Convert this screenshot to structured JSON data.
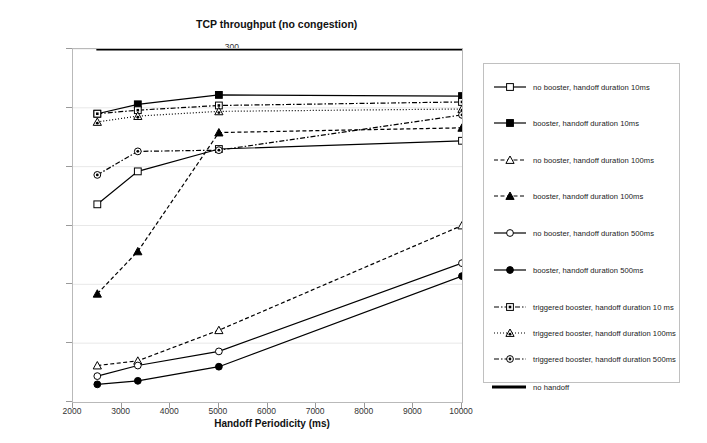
{
  "chart_data": {
    "type": "line",
    "title": "TCP throughput (no congestion)",
    "xlabel": "Handoff Periodicity (ms)",
    "ylabel": "Throughput (KB/s)",
    "xlim": [
      2000,
      10000
    ],
    "ylim": [
      0,
      300
    ],
    "xticks": [
      2000,
      3000,
      4000,
      5000,
      6000,
      7000,
      8000,
      9000,
      10000
    ],
    "yticks": [
      0,
      50,
      100,
      150,
      200,
      250,
      300
    ],
    "grid": true,
    "legend_position": "right",
    "x": [
      2500,
      3333,
      5000,
      10000
    ],
    "series": [
      {
        "name": "no booster, handoff duration 10ms",
        "values": [
          168,
          196,
          215,
          222
        ],
        "line": "solid",
        "marker": "open-square",
        "color": "#000000"
      },
      {
        "name": "booster, handoff duration 10ms",
        "values": [
          245,
          253,
          261,
          260
        ],
        "line": "solid",
        "marker": "filled-square",
        "color": "#000000"
      },
      {
        "name": "no booster, handoff duration 100ms",
        "values": [
          31,
          35,
          61,
          150
        ],
        "line": "dashed",
        "marker": "open-triangle",
        "color": "#000000"
      },
      {
        "name": "booster, handoff duration 100ms",
        "values": [
          92,
          128,
          229,
          233
        ],
        "line": "dashed",
        "marker": "filled-triangle",
        "color": "#000000"
      },
      {
        "name": "no booster, handoff duration 500ms",
        "values": [
          22,
          31,
          43,
          118
        ],
        "line": "solid",
        "marker": "open-circle",
        "color": "#000000"
      },
      {
        "name": "booster, handoff duration 500ms",
        "values": [
          15,
          18,
          30,
          107
        ],
        "line": "solid",
        "marker": "filled-circle",
        "color": "#000000"
      },
      {
        "name": "triggered booster, handoff duration 10 ms",
        "values": [
          245,
          248,
          252,
          255
        ],
        "line": "dash-dot",
        "marker": "square-dot",
        "color": "#000000"
      },
      {
        "name": "triggered booster, handoff duration 100ms",
        "values": [
          238,
          243,
          247,
          249
        ],
        "line": "dotted",
        "marker": "triangle-dot",
        "color": "#000000"
      },
      {
        "name": "triggered booster, handoff duration 500ms",
        "values": [
          193,
          213,
          214,
          244
        ],
        "line": "dash-dot",
        "marker": "circle-dot",
        "color": "#000000"
      },
      {
        "name": "no handoff",
        "values": [
          300,
          300,
          300,
          300
        ],
        "line": "thick-solid",
        "marker": "none",
        "color": "#000000"
      }
    ]
  },
  "axes": {
    "y_labels": [
      "300",
      "250",
      "200",
      "150",
      "100",
      "50",
      "0"
    ],
    "x_labels": [
      "2000",
      "3000",
      "4000",
      "5000",
      "6000",
      "7000",
      "8000",
      "9000",
      "10000"
    ]
  }
}
